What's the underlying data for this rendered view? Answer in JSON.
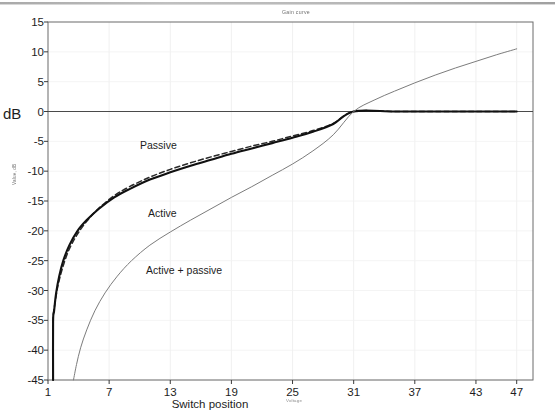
{
  "chart_data": {
    "type": "line",
    "title": "Gain curve",
    "xlabel": "Switch position",
    "ylabel": "Value, dB",
    "xaxis_subnote": "Voltage",
    "unit_prefix": "dB",
    "xlim": [
      1,
      48.6
    ],
    "ylim": [
      -45,
      15
    ],
    "xticks": [
      1,
      7,
      13,
      19,
      25,
      31,
      37,
      43,
      47
    ],
    "yticks": [
      15,
      10,
      5,
      0,
      -5,
      -10,
      -15,
      -20,
      -25,
      -30,
      -35,
      -40,
      -45
    ],
    "grid": "faint-both",
    "legend": "inline-annotations",
    "convergence_point": {
      "x": 31,
      "y": 0
    },
    "series": [
      {
        "name": "Passive",
        "style": "dashed",
        "color": "#2a2a2a",
        "width": 1.5,
        "x": [
          1.5,
          1.5,
          1.7,
          2.0,
          2.4,
          3.0,
          3.8,
          4.8,
          6.0,
          7.5,
          9.0,
          11.0,
          13.0,
          15.0,
          17.0,
          19.0,
          21.0,
          23.0,
          25.0,
          27.0,
          29.0,
          31.0,
          35.0,
          39.0,
          43.0,
          47.0
        ],
        "y": [
          -45.0,
          -35.2,
          -32.0,
          -29.0,
          -26.4,
          -23.4,
          -20.8,
          -18.4,
          -16.2,
          -14.1,
          -12.6,
          -11.0,
          -9.7,
          -8.6,
          -7.6,
          -6.7,
          -5.8,
          -5.0,
          -4.1,
          -3.2,
          -2.0,
          0.0,
          0.0,
          0.0,
          0.0,
          0.0
        ]
      },
      {
        "name": "Active",
        "style": "solid",
        "color": "#111111",
        "width": 2.1,
        "x": [
          1.5,
          1.5,
          1.6,
          1.8,
          2.1,
          2.5,
          3.1,
          3.9,
          4.8,
          6.0,
          7.5,
          9.0,
          11.0,
          13.0,
          15.0,
          17.0,
          19.0,
          21.0,
          23.0,
          25.0,
          27.0,
          29.0,
          31.0,
          35.0,
          39.0,
          43.0,
          47.0
        ],
        "y": [
          -45.0,
          -35.2,
          -33.4,
          -30.4,
          -27.6,
          -25.0,
          -22.4,
          -20.0,
          -18.2,
          -16.3,
          -14.4,
          -13.0,
          -11.4,
          -10.2,
          -9.1,
          -8.1,
          -7.1,
          -6.2,
          -5.3,
          -4.4,
          -3.4,
          -2.1,
          0.0,
          0.0,
          0.0,
          0.0,
          0.0
        ]
      },
      {
        "name": "Active + passive",
        "style": "solid",
        "color": "#7c7c7c",
        "width": 1.0,
        "x": [
          3.5,
          3.8,
          4.2,
          4.8,
          5.6,
          6.6,
          7.8,
          9.2,
          11.0,
          13.0,
          15.0,
          17.0,
          19.0,
          21.0,
          23.0,
          25.0,
          27.0,
          29.0,
          31.0,
          33.0,
          35.0,
          37.0,
          39.0,
          41.0,
          43.0,
          45.0,
          47.0
        ],
        "y": [
          -45.0,
          -42.4,
          -39.6,
          -36.6,
          -33.4,
          -30.4,
          -27.6,
          -25.0,
          -22.4,
          -20.2,
          -18.2,
          -16.3,
          -14.4,
          -12.6,
          -10.7,
          -8.8,
          -6.6,
          -3.9,
          0.0,
          1.9,
          3.4,
          4.8,
          6.1,
          7.3,
          8.4,
          9.5,
          10.5
        ]
      }
    ]
  },
  "plot_geometry": {
    "left": 48,
    "right": 533,
    "top": 22,
    "bottom": 380
  }
}
